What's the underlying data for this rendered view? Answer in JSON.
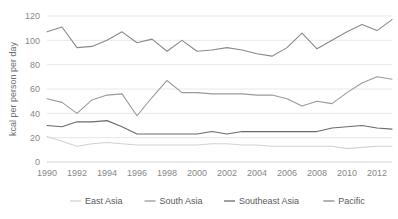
{
  "chart_data": {
    "type": "line",
    "title": "",
    "subtitle": "",
    "xlabel": "",
    "ylabel": "kcal per person per day",
    "x": [
      1990,
      1991,
      1992,
      1993,
      1994,
      1995,
      1996,
      1997,
      1998,
      1999,
      2000,
      2001,
      2002,
      2003,
      2004,
      2005,
      2006,
      2007,
      2008,
      2009,
      2010,
      2011,
      2012,
      2013
    ],
    "xlim": [
      1990,
      2013
    ],
    "ylim": [
      0,
      120
    ],
    "xticks": [
      1990,
      1992,
      1994,
      1996,
      1998,
      2000,
      2002,
      2004,
      2006,
      2008,
      2010,
      2012
    ],
    "yticks": [
      0,
      20,
      40,
      60,
      80,
      100,
      120
    ],
    "xtick_labels": [
      "1990",
      "1992",
      "1994",
      "1996",
      "1998",
      "2000",
      "2002",
      "2004",
      "2006",
      "2008",
      "2010",
      "2012"
    ],
    "ytick_labels": [
      "0",
      "20",
      "40",
      "60",
      "80",
      "100",
      "120"
    ],
    "grid": true,
    "grid_axis": "y",
    "legend_position": "bottom",
    "series": [
      {
        "name": "East Asia",
        "color": "#d2d2d2",
        "values": [
          21,
          17,
          13,
          15,
          16,
          15,
          14,
          14,
          14,
          14,
          14,
          15,
          15,
          14,
          14,
          13,
          13,
          13,
          13,
          13,
          11,
          12,
          13,
          13
        ]
      },
      {
        "name": "South Asia",
        "color": "#9a9a9a",
        "values": [
          52,
          49,
          40,
          51,
          55,
          56,
          38,
          53,
          67,
          57,
          57,
          56,
          56,
          56,
          55,
          55,
          52,
          46,
          50,
          48,
          57,
          65,
          70,
          68
        ]
      },
      {
        "name": "Southeast Asia",
        "color": "#6b6b6b",
        "values": [
          30,
          29,
          33,
          33,
          34,
          29,
          23,
          23,
          23,
          23,
          23,
          25,
          23,
          25,
          25,
          25,
          25,
          25,
          25,
          28,
          29,
          30,
          28,
          27
        ]
      },
      {
        "name": "Pacific",
        "color": "#8a8a8a",
        "values": [
          107,
          111,
          94,
          95,
          100,
          107,
          98,
          101,
          91,
          100,
          91,
          92,
          94,
          92,
          89,
          87,
          94,
          106,
          93,
          100,
          107,
          113,
          108,
          117
        ]
      }
    ]
  },
  "legend": {
    "items": [
      {
        "label": "East Asia"
      },
      {
        "label": "South Asia"
      },
      {
        "label": "Southeast Asia"
      },
      {
        "label": "Pacific"
      }
    ]
  }
}
